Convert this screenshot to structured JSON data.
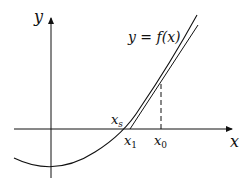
{
  "diagram": {
    "labels": {
      "y_axis": "y",
      "x_axis": "x",
      "curve": "y = f(x)",
      "root": "x",
      "root_sub": "s",
      "x1": "x",
      "x1_sub": "1",
      "x0": "x",
      "x0_sub": "0"
    },
    "colors": {
      "line": "#111111",
      "background": "#ffffff"
    }
  }
}
